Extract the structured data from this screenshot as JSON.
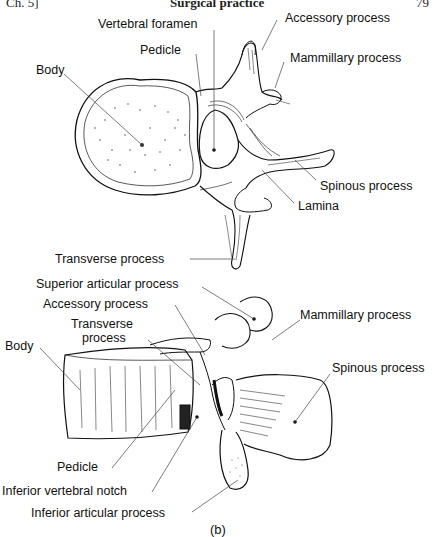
{
  "header": {
    "chapter": "Ch. 5]",
    "title": "Surgical practice",
    "page": "79"
  },
  "figure": {
    "caption": "(b)",
    "top_view": {
      "labels": {
        "vertebral_foramen": "Vertebral foramen",
        "accessory_process": "Accessory process",
        "pedicle": "Pedicle",
        "mammillary_process": "Mammillary process",
        "body": "Body",
        "spinous_process": "Spinous process",
        "lamina": "Lamina",
        "transverse_process": "Transverse process"
      }
    },
    "side_view": {
      "labels": {
        "superior_articular_process": "Superior articular process",
        "accessory_process": "Accessory process",
        "mammillary_process": "Mammillary process",
        "transverse_process_line1": "Transverse",
        "transverse_process_line2": "process",
        "body": "Body",
        "spinous_process": "Spinous process",
        "pedicle": "Pedicle",
        "inferior_vertebral_notch": "Inferior vertebral notch",
        "inferior_articular_process": "Inferior articular process"
      }
    }
  },
  "colors": {
    "ink": "#111111",
    "background": "#ffffff",
    "leader": "#444444"
  }
}
